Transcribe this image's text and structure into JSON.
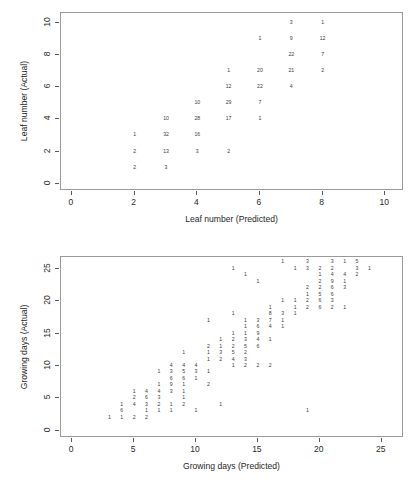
{
  "figure": {
    "background": "#ffffff",
    "frame_color": "#9a9a9a",
    "text_color": "#3d3d3d"
  },
  "chart_data": [
    {
      "id": "leaf-number",
      "type": "scatter",
      "title": "",
      "xlabel": "Leaf number (Predicted)",
      "ylabel": "Leaf number (Actual)",
      "xlim": [
        -0.35,
        10.6
      ],
      "ylim": [
        -0.45,
        10.6
      ],
      "xticks": [
        0,
        2,
        4,
        6,
        8,
        10
      ],
      "yticks": [
        0,
        2,
        4,
        6,
        8,
        10
      ],
      "xticklabels": [
        "0",
        "2",
        "4",
        "6",
        "8",
        "10"
      ],
      "yticklabels": [
        "0",
        "2",
        "4",
        "6",
        "8",
        "10"
      ],
      "grid": false,
      "legend": "none",
      "marker_style": "count-label",
      "points": [
        {
          "x": 2,
          "y": 3,
          "label": "1"
        },
        {
          "x": 2,
          "y": 2,
          "label": "2"
        },
        {
          "x": 2,
          "y": 1,
          "label": "2"
        },
        {
          "x": 3,
          "y": 4,
          "label": "10"
        },
        {
          "x": 3,
          "y": 3,
          "label": "32"
        },
        {
          "x": 3,
          "y": 2,
          "label": "13"
        },
        {
          "x": 3,
          "y": 1,
          "label": "3"
        },
        {
          "x": 4,
          "y": 5,
          "label": "10"
        },
        {
          "x": 4,
          "y": 4,
          "label": "28"
        },
        {
          "x": 4,
          "y": 3,
          "label": "16"
        },
        {
          "x": 4,
          "y": 2,
          "label": "3"
        },
        {
          "x": 5,
          "y": 7,
          "label": "1"
        },
        {
          "x": 5,
          "y": 6,
          "label": "12"
        },
        {
          "x": 5,
          "y": 5,
          "label": "29"
        },
        {
          "x": 5,
          "y": 4,
          "label": "17"
        },
        {
          "x": 5,
          "y": 2,
          "label": "2"
        },
        {
          "x": 6,
          "y": 9,
          "label": "1"
        },
        {
          "x": 6,
          "y": 7,
          "label": "20"
        },
        {
          "x": 6,
          "y": 6,
          "label": "22"
        },
        {
          "x": 6,
          "y": 5,
          "label": "7"
        },
        {
          "x": 6,
          "y": 4,
          "label": "1"
        },
        {
          "x": 7,
          "y": 10,
          "label": "3"
        },
        {
          "x": 7,
          "y": 9,
          "label": "9"
        },
        {
          "x": 7,
          "y": 8,
          "label": "22"
        },
        {
          "x": 7,
          "y": 7,
          "label": "21"
        },
        {
          "x": 7,
          "y": 6,
          "label": "4"
        },
        {
          "x": 8,
          "y": 10,
          "label": "1"
        },
        {
          "x": 8,
          "y": 9,
          "label": "12"
        },
        {
          "x": 8,
          "y": 8,
          "label": "7"
        },
        {
          "x": 8,
          "y": 7,
          "label": "2"
        }
      ]
    },
    {
      "id": "growing-days",
      "type": "scatter",
      "title": "",
      "xlabel": "Growing days (Predicted)",
      "ylabel": "Growing days (Actual)",
      "xlim": [
        -0.9,
        26.8
      ],
      "ylim": [
        -1.1,
        26.8
      ],
      "xticks": [
        0,
        5,
        10,
        15,
        20,
        25
      ],
      "yticks": [
        0,
        5,
        10,
        15,
        20,
        25
      ],
      "xticklabels": [
        "0",
        "5",
        "10",
        "15",
        "20",
        "25"
      ],
      "yticklabels": [
        "0",
        "5",
        "10",
        "15",
        "20",
        "25"
      ],
      "grid": false,
      "legend": "none",
      "marker_style": "count-label",
      "points": [
        {
          "x": 3,
          "y": 2,
          "label": "1"
        },
        {
          "x": 4,
          "y": 4,
          "label": "1"
        },
        {
          "x": 4,
          "y": 3,
          "label": "6"
        },
        {
          "x": 4,
          "y": 2,
          "label": "1"
        },
        {
          "x": 5,
          "y": 6,
          "label": "1"
        },
        {
          "x": 5,
          "y": 5,
          "label": "2"
        },
        {
          "x": 5,
          "y": 4,
          "label": "4"
        },
        {
          "x": 5,
          "y": 2,
          "label": "2"
        },
        {
          "x": 6,
          "y": 6,
          "label": "4"
        },
        {
          "x": 6,
          "y": 5,
          "label": "6"
        },
        {
          "x": 6,
          "y": 4,
          "label": "3"
        },
        {
          "x": 6,
          "y": 3,
          "label": "1"
        },
        {
          "x": 6,
          "y": 2,
          "label": "2"
        },
        {
          "x": 7,
          "y": 9,
          "label": "1"
        },
        {
          "x": 7,
          "y": 7,
          "label": "1"
        },
        {
          "x": 7,
          "y": 6,
          "label": "4"
        },
        {
          "x": 7,
          "y": 5,
          "label": "3"
        },
        {
          "x": 7,
          "y": 4,
          "label": "2"
        },
        {
          "x": 7,
          "y": 3,
          "label": "1"
        },
        {
          "x": 8,
          "y": 10,
          "label": "4"
        },
        {
          "x": 8,
          "y": 9,
          "label": "3"
        },
        {
          "x": 8,
          "y": 8,
          "label": "6"
        },
        {
          "x": 8,
          "y": 7,
          "label": "9"
        },
        {
          "x": 8,
          "y": 6,
          "label": "3"
        },
        {
          "x": 8,
          "y": 4,
          "label": "1"
        },
        {
          "x": 8,
          "y": 3,
          "label": "1"
        },
        {
          "x": 9,
          "y": 12,
          "label": "1"
        },
        {
          "x": 9,
          "y": 10,
          "label": "4"
        },
        {
          "x": 9,
          "y": 9,
          "label": "5"
        },
        {
          "x": 9,
          "y": 8,
          "label": "6"
        },
        {
          "x": 9,
          "y": 7,
          "label": "1"
        },
        {
          "x": 9,
          "y": 6,
          "label": "1"
        },
        {
          "x": 9,
          "y": 5,
          "label": "1"
        },
        {
          "x": 9,
          "y": 4,
          "label": "2"
        },
        {
          "x": 10,
          "y": 10,
          "label": "4"
        },
        {
          "x": 10,
          "y": 9,
          "label": "3"
        },
        {
          "x": 10,
          "y": 8,
          "label": "1"
        },
        {
          "x": 10,
          "y": 3,
          "label": "1"
        },
        {
          "x": 11,
          "y": 17,
          "label": "1"
        },
        {
          "x": 11,
          "y": 13,
          "label": "2"
        },
        {
          "x": 11,
          "y": 12,
          "label": "1"
        },
        {
          "x": 11,
          "y": 11,
          "label": "1"
        },
        {
          "x": 11,
          "y": 9,
          "label": "1"
        },
        {
          "x": 11,
          "y": 7,
          "label": "2"
        },
        {
          "x": 12,
          "y": 14,
          "label": "1"
        },
        {
          "x": 12,
          "y": 13,
          "label": "1"
        },
        {
          "x": 12,
          "y": 12,
          "label": "3"
        },
        {
          "x": 12,
          "y": 11,
          "label": "2"
        },
        {
          "x": 12,
          "y": 4,
          "label": "1"
        },
        {
          "x": 13,
          "y": 25,
          "label": "1"
        },
        {
          "x": 13,
          "y": 18,
          "label": "1"
        },
        {
          "x": 13,
          "y": 15,
          "label": "1"
        },
        {
          "x": 13,
          "y": 14,
          "label": "2"
        },
        {
          "x": 13,
          "y": 13,
          "label": "2"
        },
        {
          "x": 13,
          "y": 12,
          "label": "5"
        },
        {
          "x": 13,
          "y": 11,
          "label": "4"
        },
        {
          "x": 13,
          "y": 10,
          "label": "1"
        },
        {
          "x": 14,
          "y": 24,
          "label": "1"
        },
        {
          "x": 14,
          "y": 17,
          "label": "1"
        },
        {
          "x": 14,
          "y": 16,
          "label": "1"
        },
        {
          "x": 14,
          "y": 15,
          "label": "1"
        },
        {
          "x": 14,
          "y": 14,
          "label": "3"
        },
        {
          "x": 14,
          "y": 13,
          "label": "5"
        },
        {
          "x": 14,
          "y": 12,
          "label": "2"
        },
        {
          "x": 14,
          "y": 11,
          "label": "3"
        },
        {
          "x": 14,
          "y": 10,
          "label": "2"
        },
        {
          "x": 15,
          "y": 23,
          "label": "1"
        },
        {
          "x": 15,
          "y": 17,
          "label": "3"
        },
        {
          "x": 15,
          "y": 16,
          "label": "6"
        },
        {
          "x": 15,
          "y": 15,
          "label": "9"
        },
        {
          "x": 15,
          "y": 14,
          "label": "4"
        },
        {
          "x": 15,
          "y": 13,
          "label": "6"
        },
        {
          "x": 15,
          "y": 10,
          "label": "2"
        },
        {
          "x": 16,
          "y": 19,
          "label": "1"
        },
        {
          "x": 16,
          "y": 18,
          "label": "8"
        },
        {
          "x": 16,
          "y": 17,
          "label": "7"
        },
        {
          "x": 16,
          "y": 16,
          "label": "4"
        },
        {
          "x": 16,
          "y": 14,
          "label": "1"
        },
        {
          "x": 16,
          "y": 10,
          "label": "2"
        },
        {
          "x": 17,
          "y": 26,
          "label": "1"
        },
        {
          "x": 17,
          "y": 20,
          "label": "1"
        },
        {
          "x": 17,
          "y": 18,
          "label": "3"
        },
        {
          "x": 17,
          "y": 17,
          "label": "1"
        },
        {
          "x": 17,
          "y": 16,
          "label": "1"
        },
        {
          "x": 18,
          "y": 25,
          "label": "1"
        },
        {
          "x": 18,
          "y": 20,
          "label": "1"
        },
        {
          "x": 18,
          "y": 19,
          "label": "1"
        },
        {
          "x": 18,
          "y": 18,
          "label": "1"
        },
        {
          "x": 19,
          "y": 26,
          "label": "3"
        },
        {
          "x": 19,
          "y": 25,
          "label": "3"
        },
        {
          "x": 19,
          "y": 22,
          "label": "2"
        },
        {
          "x": 19,
          "y": 21,
          "label": "1"
        },
        {
          "x": 19,
          "y": 20,
          "label": "2"
        },
        {
          "x": 19,
          "y": 19,
          "label": "2"
        },
        {
          "x": 19,
          "y": 3,
          "label": "1"
        },
        {
          "x": 20,
          "y": 25,
          "label": "2"
        },
        {
          "x": 20,
          "y": 24,
          "label": "1"
        },
        {
          "x": 20,
          "y": 23,
          "label": "2"
        },
        {
          "x": 20,
          "y": 22,
          "label": "2"
        },
        {
          "x": 20,
          "y": 21,
          "label": "5"
        },
        {
          "x": 20,
          "y": 20,
          "label": "6"
        },
        {
          "x": 20,
          "y": 19,
          "label": "6"
        },
        {
          "x": 21,
          "y": 26,
          "label": "3"
        },
        {
          "x": 21,
          "y": 25,
          "label": "2"
        },
        {
          "x": 21,
          "y": 24,
          "label": "4"
        },
        {
          "x": 21,
          "y": 23,
          "label": "9"
        },
        {
          "x": 21,
          "y": 22,
          "label": "6"
        },
        {
          "x": 21,
          "y": 21,
          "label": "6"
        },
        {
          "x": 21,
          "y": 20,
          "label": "3"
        },
        {
          "x": 21,
          "y": 19,
          "label": "2"
        },
        {
          "x": 22,
          "y": 26,
          "label": "1"
        },
        {
          "x": 22,
          "y": 24,
          "label": "4"
        },
        {
          "x": 22,
          "y": 23,
          "label": "1"
        },
        {
          "x": 22,
          "y": 22,
          "label": "3"
        },
        {
          "x": 22,
          "y": 19,
          "label": "1"
        },
        {
          "x": 23,
          "y": 26,
          "label": "5"
        },
        {
          "x": 23,
          "y": 25,
          "label": "3"
        },
        {
          "x": 23,
          "y": 24,
          "label": "2"
        },
        {
          "x": 24,
          "y": 25,
          "label": "1"
        }
      ]
    }
  ]
}
